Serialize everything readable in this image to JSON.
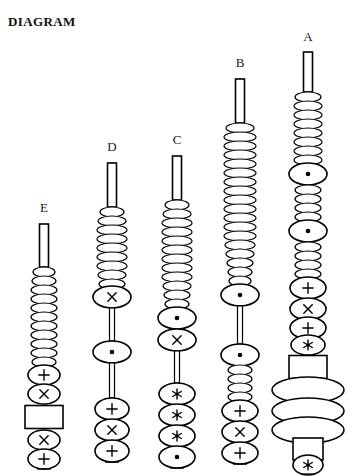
{
  "title": "DIAGRAM",
  "canvas": {
    "width": 353,
    "height": 476,
    "background": "#ffffff",
    "ink": "#000000"
  },
  "legend_symbols": {
    "dot": "⊙",
    "cross": "×",
    "plus": "+",
    "asterisk": "✻",
    "plain": ""
  },
  "columns": [
    {
      "id": "E",
      "label": "E",
      "label_x": 44,
      "label_y": 213,
      "axis_x": 44,
      "stem": {
        "x": 44,
        "top": 224,
        "bottom": 267,
        "width": 9
      },
      "beads": [
        {
          "type": "ellipse",
          "cy": 272,
          "rx": 11,
          "ry": 5,
          "symbol": "plain"
        },
        {
          "type": "ellipse",
          "cy": 281,
          "rx": 12,
          "ry": 5,
          "symbol": "plain"
        },
        {
          "type": "ellipse",
          "cy": 290,
          "rx": 13,
          "ry": 5,
          "symbol": "plain"
        },
        {
          "type": "ellipse",
          "cy": 299,
          "rx": 13,
          "ry": 5,
          "symbol": "plain"
        },
        {
          "type": "ellipse",
          "cy": 308,
          "rx": 13,
          "ry": 5,
          "symbol": "plain"
        },
        {
          "type": "ellipse",
          "cy": 317,
          "rx": 13,
          "ry": 5,
          "symbol": "plain"
        },
        {
          "type": "ellipse",
          "cy": 326,
          "rx": 13,
          "ry": 5,
          "symbol": "plain"
        },
        {
          "type": "ellipse",
          "cy": 335,
          "rx": 13,
          "ry": 5,
          "symbol": "plain"
        },
        {
          "type": "ellipse",
          "cy": 344,
          "rx": 13,
          "ry": 5,
          "symbol": "plain"
        },
        {
          "type": "ellipse",
          "cy": 353,
          "rx": 13,
          "ry": 5,
          "symbol": "plain"
        },
        {
          "type": "ellipse",
          "cy": 362,
          "rx": 12,
          "ry": 5,
          "symbol": "plain"
        },
        {
          "type": "ellipse",
          "cy": 375,
          "rx": 16,
          "ry": 10,
          "symbol": "plus"
        },
        {
          "type": "ellipse",
          "cy": 394,
          "rx": 16,
          "ry": 10,
          "symbol": "cross"
        },
        {
          "type": "rect",
          "cy": 417,
          "w": 38,
          "h": 23
        },
        {
          "type": "ellipse",
          "cy": 440,
          "rx": 16,
          "ry": 10,
          "symbol": "cross"
        },
        {
          "type": "ellipse",
          "cy": 459,
          "rx": 16,
          "ry": 10,
          "symbol": "plus"
        }
      ],
      "base_tick_y": 469
    },
    {
      "id": "D",
      "label": "D",
      "label_x": 112,
      "label_y": 152,
      "axis_x": 112,
      "stem": {
        "x": 112,
        "top": 163,
        "bottom": 207,
        "width": 9
      },
      "beads": [
        {
          "type": "ellipse",
          "cy": 212,
          "rx": 12,
          "ry": 5,
          "symbol": "plain"
        },
        {
          "type": "ellipse",
          "cy": 221,
          "rx": 14,
          "ry": 5,
          "symbol": "plain"
        },
        {
          "type": "ellipse",
          "cy": 230,
          "rx": 15,
          "ry": 5,
          "symbol": "plain"
        },
        {
          "type": "ellipse",
          "cy": 239,
          "rx": 15,
          "ry": 5,
          "symbol": "plain"
        },
        {
          "type": "ellipse",
          "cy": 248,
          "rx": 15,
          "ry": 5,
          "symbol": "plain"
        },
        {
          "type": "ellipse",
          "cy": 257,
          "rx": 15,
          "ry": 5,
          "symbol": "plain"
        },
        {
          "type": "ellipse",
          "cy": 266,
          "rx": 15,
          "ry": 5,
          "symbol": "plain"
        },
        {
          "type": "ellipse",
          "cy": 275,
          "rx": 14,
          "ry": 5,
          "symbol": "plain"
        },
        {
          "type": "ellipse",
          "cy": 284,
          "rx": 13,
          "ry": 5,
          "symbol": "plain"
        },
        {
          "type": "ellipse",
          "cy": 297,
          "rx": 19,
          "ry": 11,
          "symbol": "cross"
        },
        {
          "type": "rod",
          "top": 308,
          "bottom": 341,
          "width": 5
        },
        {
          "type": "ellipse",
          "cy": 352,
          "rx": 19,
          "ry": 11,
          "symbol": "dot"
        },
        {
          "type": "rod",
          "top": 363,
          "bottom": 398,
          "width": 5
        },
        {
          "type": "ellipse",
          "cy": 409,
          "rx": 17,
          "ry": 11,
          "symbol": "plus"
        },
        {
          "type": "ellipse",
          "cy": 430,
          "rx": 17,
          "ry": 11,
          "symbol": "cross"
        },
        {
          "type": "ellipse",
          "cy": 451,
          "rx": 17,
          "ry": 11,
          "symbol": "plus"
        }
      ],
      "base_tick_y": 462
    },
    {
      "id": "C",
      "label": "C",
      "label_x": 177,
      "label_y": 145,
      "axis_x": 177,
      "stem": {
        "x": 177,
        "top": 156,
        "bottom": 200,
        "width": 9
      },
      "beads": [
        {
          "type": "ellipse",
          "cy": 205,
          "rx": 12,
          "ry": 5,
          "symbol": "plain"
        },
        {
          "type": "ellipse",
          "cy": 214,
          "rx": 14,
          "ry": 5,
          "symbol": "plain"
        },
        {
          "type": "ellipse",
          "cy": 223,
          "rx": 15,
          "ry": 5,
          "symbol": "plain"
        },
        {
          "type": "ellipse",
          "cy": 232,
          "rx": 15,
          "ry": 5,
          "symbol": "plain"
        },
        {
          "type": "ellipse",
          "cy": 241,
          "rx": 15,
          "ry": 5,
          "symbol": "plain"
        },
        {
          "type": "ellipse",
          "cy": 250,
          "rx": 15,
          "ry": 5,
          "symbol": "plain"
        },
        {
          "type": "ellipse",
          "cy": 259,
          "rx": 15,
          "ry": 5,
          "symbol": "plain"
        },
        {
          "type": "ellipse",
          "cy": 268,
          "rx": 15,
          "ry": 5,
          "symbol": "plain"
        },
        {
          "type": "ellipse",
          "cy": 277,
          "rx": 15,
          "ry": 5,
          "symbol": "plain"
        },
        {
          "type": "ellipse",
          "cy": 286,
          "rx": 14,
          "ry": 5,
          "symbol": "plain"
        },
        {
          "type": "ellipse",
          "cy": 295,
          "rx": 13,
          "ry": 5,
          "symbol": "plain"
        },
        {
          "type": "ellipse",
          "cy": 304,
          "rx": 12,
          "ry": 5,
          "symbol": "plain"
        },
        {
          "type": "ellipse",
          "cy": 318,
          "rx": 19,
          "ry": 11,
          "symbol": "dot"
        },
        {
          "type": "ellipse",
          "cy": 340,
          "rx": 19,
          "ry": 11,
          "symbol": "cross"
        },
        {
          "type": "rod",
          "top": 351,
          "bottom": 383,
          "width": 5
        },
        {
          "type": "ellipse",
          "cy": 394,
          "rx": 18,
          "ry": 11,
          "symbol": "asterisk"
        },
        {
          "type": "ellipse",
          "cy": 415,
          "rx": 18,
          "ry": 11,
          "symbol": "asterisk"
        },
        {
          "type": "ellipse",
          "cy": 436,
          "rx": 18,
          "ry": 11,
          "symbol": "asterisk"
        },
        {
          "type": "ellipse",
          "cy": 457,
          "rx": 18,
          "ry": 11,
          "symbol": "dot"
        }
      ],
      "base_tick_y": 468
    },
    {
      "id": "B",
      "label": "B",
      "label_x": 240,
      "label_y": 68,
      "axis_x": 240,
      "stem": {
        "x": 240,
        "top": 79,
        "bottom": 123,
        "width": 9
      },
      "beads": [
        {
          "type": "ellipse",
          "cy": 128,
          "rx": 14,
          "ry": 5,
          "symbol": "plain"
        },
        {
          "type": "ellipse",
          "cy": 137,
          "rx": 16,
          "ry": 5,
          "symbol": "plain"
        },
        {
          "type": "ellipse",
          "cy": 146,
          "rx": 16,
          "ry": 5,
          "symbol": "plain"
        },
        {
          "type": "ellipse",
          "cy": 155,
          "rx": 16,
          "ry": 5,
          "symbol": "plain"
        },
        {
          "type": "ellipse",
          "cy": 164,
          "rx": 16,
          "ry": 5,
          "symbol": "plain"
        },
        {
          "type": "ellipse",
          "cy": 173,
          "rx": 16,
          "ry": 5,
          "symbol": "plain"
        },
        {
          "type": "ellipse",
          "cy": 182,
          "rx": 16,
          "ry": 5,
          "symbol": "plain"
        },
        {
          "type": "ellipse",
          "cy": 191,
          "rx": 16,
          "ry": 5,
          "symbol": "plain"
        },
        {
          "type": "ellipse",
          "cy": 200,
          "rx": 16,
          "ry": 5,
          "symbol": "plain"
        },
        {
          "type": "ellipse",
          "cy": 209,
          "rx": 16,
          "ry": 5,
          "symbol": "plain"
        },
        {
          "type": "ellipse",
          "cy": 218,
          "rx": 16,
          "ry": 5,
          "symbol": "plain"
        },
        {
          "type": "ellipse",
          "cy": 227,
          "rx": 16,
          "ry": 5,
          "symbol": "plain"
        },
        {
          "type": "ellipse",
          "cy": 236,
          "rx": 16,
          "ry": 5,
          "symbol": "plain"
        },
        {
          "type": "ellipse",
          "cy": 245,
          "rx": 15,
          "ry": 5,
          "symbol": "plain"
        },
        {
          "type": "ellipse",
          "cy": 254,
          "rx": 14,
          "ry": 5,
          "symbol": "plain"
        },
        {
          "type": "ellipse",
          "cy": 263,
          "rx": 13,
          "ry": 5,
          "symbol": "plain"
        },
        {
          "type": "ellipse",
          "cy": 272,
          "rx": 12,
          "ry": 5,
          "symbol": "plain"
        },
        {
          "type": "ellipse",
          "cy": 281,
          "rx": 11,
          "ry": 5,
          "symbol": "plain"
        },
        {
          "type": "ellipse",
          "cy": 295,
          "rx": 19,
          "ry": 11,
          "symbol": "dot"
        },
        {
          "type": "rod",
          "top": 306,
          "bottom": 344,
          "width": 5
        },
        {
          "type": "ellipse",
          "cy": 355,
          "rx": 19,
          "ry": 11,
          "symbol": "dot"
        },
        {
          "type": "ellipse",
          "cy": 370,
          "rx": 12,
          "ry": 5,
          "symbol": "plain"
        },
        {
          "type": "ellipse",
          "cy": 379,
          "rx": 12,
          "ry": 5,
          "symbol": "plain"
        },
        {
          "type": "ellipse",
          "cy": 388,
          "rx": 12,
          "ry": 5,
          "symbol": "plain"
        },
        {
          "type": "ellipse",
          "cy": 397,
          "rx": 12,
          "ry": 5,
          "symbol": "plain"
        },
        {
          "type": "ellipse",
          "cy": 411,
          "rx": 18,
          "ry": 11,
          "symbol": "plus"
        },
        {
          "type": "ellipse",
          "cy": 432,
          "rx": 18,
          "ry": 11,
          "symbol": "cross"
        },
        {
          "type": "ellipse",
          "cy": 453,
          "rx": 18,
          "ry": 11,
          "symbol": "plus"
        }
      ],
      "base_tick_y": 464
    },
    {
      "id": "A",
      "label": "A",
      "label_x": 308,
      "label_y": 42,
      "axis_x": 308,
      "stem": {
        "x": 308,
        "top": 52,
        "bottom": 92,
        "width": 9
      },
      "beads": [
        {
          "type": "ellipse",
          "cy": 97,
          "rx": 13,
          "ry": 5,
          "symbol": "plain"
        },
        {
          "type": "ellipse",
          "cy": 106,
          "rx": 14,
          "ry": 5,
          "symbol": "plain"
        },
        {
          "type": "ellipse",
          "cy": 115,
          "rx": 14,
          "ry": 5,
          "symbol": "plain"
        },
        {
          "type": "ellipse",
          "cy": 124,
          "rx": 14,
          "ry": 5,
          "symbol": "plain"
        },
        {
          "type": "ellipse",
          "cy": 133,
          "rx": 14,
          "ry": 5,
          "symbol": "plain"
        },
        {
          "type": "ellipse",
          "cy": 142,
          "rx": 14,
          "ry": 5,
          "symbol": "plain"
        },
        {
          "type": "ellipse",
          "cy": 151,
          "rx": 14,
          "ry": 5,
          "symbol": "plain"
        },
        {
          "type": "ellipse",
          "cy": 160,
          "rx": 14,
          "ry": 5,
          "symbol": "plain"
        },
        {
          "type": "ellipse",
          "cy": 174,
          "rx": 19,
          "ry": 11,
          "symbol": "dot"
        },
        {
          "type": "ellipse",
          "cy": 190,
          "rx": 13,
          "ry": 5,
          "symbol": "plain"
        },
        {
          "type": "ellipse",
          "cy": 199,
          "rx": 13,
          "ry": 5,
          "symbol": "plain"
        },
        {
          "type": "ellipse",
          "cy": 208,
          "rx": 13,
          "ry": 5,
          "symbol": "plain"
        },
        {
          "type": "ellipse",
          "cy": 217,
          "rx": 13,
          "ry": 5,
          "symbol": "plain"
        },
        {
          "type": "ellipse",
          "cy": 231,
          "rx": 19,
          "ry": 11,
          "symbol": "dot"
        },
        {
          "type": "ellipse",
          "cy": 247,
          "rx": 13,
          "ry": 5,
          "symbol": "plain"
        },
        {
          "type": "ellipse",
          "cy": 256,
          "rx": 13,
          "ry": 5,
          "symbol": "plain"
        },
        {
          "type": "ellipse",
          "cy": 265,
          "rx": 13,
          "ry": 5,
          "symbol": "plain"
        },
        {
          "type": "ellipse",
          "cy": 274,
          "rx": 13,
          "ry": 5,
          "symbol": "plain"
        },
        {
          "type": "ellipse",
          "cy": 288,
          "rx": 18,
          "ry": 11,
          "symbol": "plus"
        },
        {
          "type": "ellipse",
          "cy": 309,
          "rx": 18,
          "ry": 11,
          "symbol": "cross"
        },
        {
          "type": "ellipse",
          "cy": 328,
          "rx": 18,
          "ry": 11,
          "symbol": "plus"
        },
        {
          "type": "ellipse",
          "cy": 345,
          "rx": 17,
          "ry": 10,
          "symbol": "asterisk"
        },
        {
          "type": "rect",
          "cy": 367,
          "w": 38,
          "h": 23
        },
        {
          "type": "ellipse",
          "cy": 390,
          "rx": 36,
          "ry": 13,
          "symbol": "plain"
        },
        {
          "type": "ellipse",
          "cy": 411,
          "rx": 36,
          "ry": 13,
          "symbol": "plain"
        },
        {
          "type": "ellipse",
          "cy": 430,
          "rx": 36,
          "ry": 13,
          "symbol": "plain"
        },
        {
          "type": "rect",
          "cy": 449,
          "w": 30,
          "h": 22
        },
        {
          "type": "ellipse",
          "cy": 465,
          "rx": 15,
          "ry": 10,
          "symbol": "asterisk"
        }
      ],
      "base_tick_y": 474
    }
  ]
}
